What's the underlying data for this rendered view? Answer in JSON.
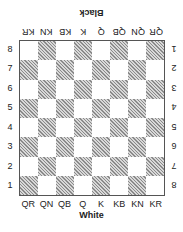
{
  "top_player": "Black",
  "bottom_player": "White",
  "files_bottom": [
    "QR",
    "QN",
    "QB",
    "Q",
    "K",
    "KB",
    "KN",
    "KR"
  ],
  "files_top": [
    "QR",
    "QN",
    "QB",
    "Q",
    "K",
    "KB",
    "KN",
    "KR"
  ],
  "ranks_left": [
    "8",
    "7",
    "6",
    "5",
    "4",
    "3",
    "2",
    "1"
  ],
  "ranks_right": [
    "1",
    "2",
    "3",
    "4",
    "5",
    "6",
    "7",
    "8"
  ],
  "square_colors": {
    "light": "#ffffff",
    "dark": "hatched gray"
  }
}
